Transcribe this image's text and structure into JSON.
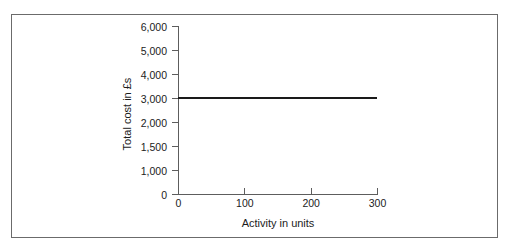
{
  "chart_data": {
    "type": "line",
    "title": "",
    "subtitle": "",
    "xlabel": "Activity in units",
    "ylabel": "Total cost in £s",
    "x": [
      0,
      300
    ],
    "values": [
      3000,
      3000
    ],
    "series": [
      {
        "name": "Total cost",
        "x": [
          0,
          300
        ],
        "values": [
          3000,
          3000
        ],
        "color": "#1a1a1a"
      }
    ],
    "xticks": [
      {
        "value": 0,
        "label": "0"
      },
      {
        "value": 100,
        "label": "100"
      },
      {
        "value": 200,
        "label": "200"
      },
      {
        "value": 300,
        "label": "300"
      }
    ],
    "yticks": [
      {
        "value": 6000,
        "label": "6,000"
      },
      {
        "value": 5000,
        "label": "5,000"
      },
      {
        "value": 4000,
        "label": "4,000"
      },
      {
        "value": 3000,
        "label": "3,000"
      },
      {
        "value": 2000,
        "label": "2,000"
      },
      {
        "value": 1500,
        "label": "1,500"
      },
      {
        "value": 1000,
        "label": "1,000"
      },
      {
        "value": 0,
        "label": "0"
      }
    ],
    "xlim": [
      0,
      300
    ],
    "ylim": [
      0,
      6000
    ],
    "grid": false,
    "legend": false,
    "legend_position": "none",
    "annotations": [],
    "axis_color": "#5d5d5d",
    "line_color": "#1a1a1a",
    "border_color": "#6b6b6b",
    "background": "#ffffff"
  }
}
